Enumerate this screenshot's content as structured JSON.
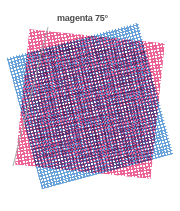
{
  "figure": {
    "label": "magenta 75°",
    "label_color": "#4d4d4d",
    "background": "#ffffff",
    "leader_line": {
      "color": "#9aa0a0",
      "x1": 48,
      "y1": 27,
      "x2": 13,
      "y2": 166,
      "width": 0.9
    },
    "screens": [
      {
        "name": "cyan-screen",
        "ink": "cyan",
        "color": "#4f93d4",
        "angle_deg": 15,
        "pattern": "halftone-dot-grid"
      },
      {
        "name": "magenta-screen",
        "ink": "magenta",
        "color": "#e8417f",
        "angle_deg": 75,
        "pattern": "halftone-dot-grid"
      }
    ],
    "moire": {
      "name": "moire-rosette",
      "color": "#962878"
    }
  },
  "chart_data": {
    "type": "diagram",
    "title": "magenta 75°",
    "series": [
      {
        "name": "cyan screen",
        "angle_deg": 15,
        "color": "#4f93d4"
      },
      {
        "name": "magenta screen",
        "angle_deg": 75,
        "color": "#e8417f"
      }
    ],
    "annotations": [
      {
        "text": "magenta 75°",
        "target": "magenta screen",
        "leader": true
      }
    ],
    "xlabel": "",
    "ylabel": "",
    "grid": false,
    "legend": "none"
  }
}
